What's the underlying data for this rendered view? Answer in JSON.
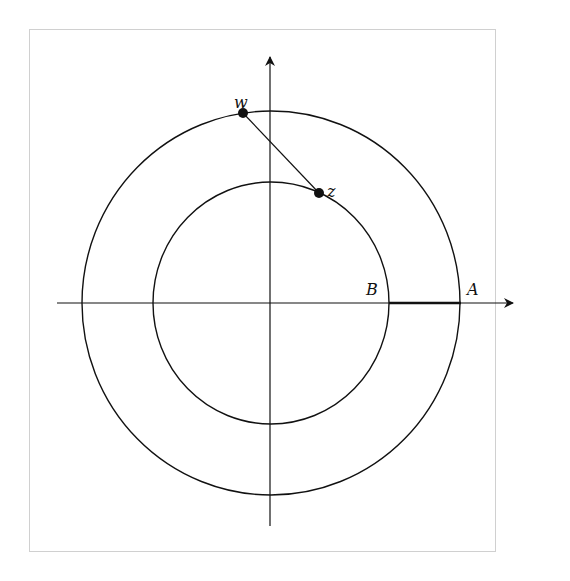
{
  "diagram": {
    "title": "",
    "center": {
      "x": 271,
      "y": 303
    },
    "outer_circle": {
      "rx": 189,
      "ry": 192
    },
    "inner_circle": {
      "rx": 118,
      "ry": 121
    },
    "axes": {
      "x": {
        "x1": 57,
        "x2": 513,
        "y": 303
      },
      "y": {
        "x": 270,
        "y1": 526,
        "y2": 57
      }
    },
    "points": [
      {
        "label": "w",
        "x": 243,
        "y": 113
      },
      {
        "label": "z",
        "x": 319,
        "y": 193
      }
    ],
    "labels": {
      "w": "w",
      "z": "z",
      "A": "A",
      "B": "B"
    },
    "highlighted_segment": {
      "from": "B",
      "to": "A",
      "x1": 389,
      "x2": 461,
      "y": 303
    },
    "colors": {
      "stroke": "#111111",
      "frame": "#d0d0d0"
    }
  }
}
